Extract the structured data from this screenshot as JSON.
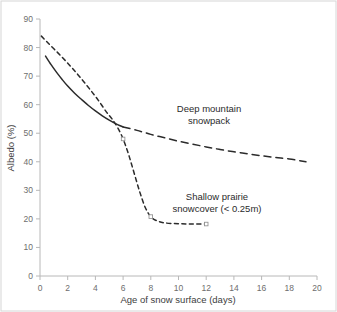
{
  "chart_data": {
    "type": "line",
    "title": "",
    "xlabel": "Age of snow surface (days)",
    "ylabel": "Albedo (%)",
    "xlim": [
      0,
      20
    ],
    "ylim": [
      0,
      90
    ],
    "xticks": [
      0,
      2,
      4,
      6,
      8,
      10,
      12,
      14,
      16,
      18,
      20
    ],
    "yticks": [
      0,
      10,
      20,
      30,
      40,
      50,
      60,
      70,
      80,
      90
    ],
    "grid": false,
    "legend_position": "inline-annotations",
    "series": [
      {
        "name": "Deep mountain snowpack",
        "style": "solid-then-long-dash",
        "color": "#2b2b2b",
        "x": [
          0.4,
          0.8,
          1.2,
          1.6,
          2.0,
          2.5,
          3.0,
          3.5,
          4.0,
          4.5,
          5.0,
          5.6,
          6.0,
          7.0,
          8.0,
          9.0,
          10.0,
          11.0,
          12.0,
          13.0,
          14.0,
          15.0,
          16.0,
          17.0,
          18.0,
          19.2
        ],
        "y": [
          77.0,
          74.0,
          71.3,
          68.8,
          66.5,
          64.0,
          61.8,
          59.7,
          57.8,
          56.1,
          54.6,
          53.0,
          52.2,
          51.0,
          49.6,
          48.4,
          47.2,
          46.2,
          45.2,
          44.3,
          43.5,
          42.8,
          42.1,
          41.5,
          41.0,
          40.0
        ]
      },
      {
        "name": "Shallow prairie snowcover (< 0.25m)",
        "style": "short-dash",
        "color": "#2b2b2b",
        "x": [
          0.1,
          0.6,
          1.2,
          1.8,
          2.4,
          3.0,
          3.6,
          4.2,
          4.8,
          5.2,
          5.6,
          6.0,
          6.4,
          6.8,
          7.2,
          7.6,
          8.0,
          8.4,
          9.0,
          10.0,
          11.0,
          12.0
        ],
        "y": [
          84.0,
          81.5,
          78.6,
          75.6,
          72.4,
          69.0,
          65.4,
          61.6,
          57.4,
          55.0,
          52.0,
          48.0,
          42.5,
          36.0,
          29.5,
          24.0,
          20.8,
          19.4,
          18.6,
          18.3,
          18.2,
          18.2
        ]
      }
    ],
    "annotations": [
      {
        "name": "deep-mountain-label",
        "lines": [
          "Deep mountain",
          "snowpack"
        ],
        "x_px": 209,
        "y_px": 112
      },
      {
        "name": "shallow-prairie-label",
        "lines": [
          "Shallow prairie",
          "snowcover (< 0.25m)"
        ],
        "x_px": 217,
        "y_px": 200
      }
    ],
    "markers": [
      {
        "series": "Shallow prairie snowcover (< 0.25m)",
        "x": 6.0,
        "y": 48.0
      },
      {
        "series": "Shallow prairie snowcover (< 0.25m)",
        "x": 8.0,
        "y": 20.8
      },
      {
        "series": "Shallow prairie snowcover (< 0.25m)",
        "x": 12.0,
        "y": 18.2
      }
    ],
    "colors": {
      "line": "#2b2b2b",
      "axis": "#b8b8b8",
      "frame": "#d6d6d6",
      "tick_text": "#6e6e6e",
      "title_text": "#3d3d3d",
      "background": "#ffffff"
    }
  }
}
